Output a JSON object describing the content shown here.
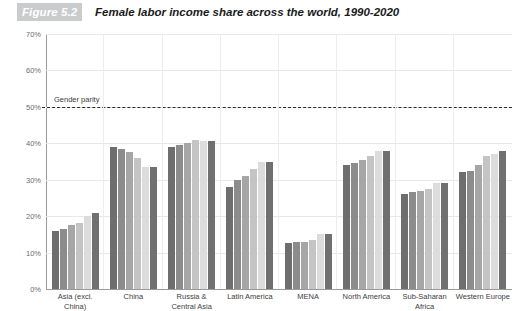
{
  "figure": {
    "badge": "Figure 5.2",
    "title": "Female labor income share across the world, 1990-2020"
  },
  "annotation": {
    "parity_label": "Gender parity",
    "parity_value": 50
  },
  "colors": {
    "badge_background": "#c9cbcc",
    "axis": "#9a9a9a",
    "gridline": "#e8e8e8",
    "parity_line": "#2b2b2b",
    "series": [
      "#6e6e6e",
      "#8c8c8c",
      "#a6a6a6",
      "#c4c4c4",
      "#dcdcdc",
      "#707070"
    ]
  },
  "chart_data": {
    "type": "bar",
    "title": "Female labor income share across the world, 1990-2020",
    "xlabel": "",
    "ylabel": "",
    "ylim": [
      0,
      70
    ],
    "ytick_labels": [
      "70%",
      "60%",
      "50%",
      "40%",
      "30%",
      "20%",
      "10%",
      "0%"
    ],
    "ytick_values": [
      70,
      60,
      50,
      40,
      30,
      20,
      10,
      0
    ],
    "grid": true,
    "legend_position": "bottom",
    "categories": [
      "Asia (excl. China)",
      "China",
      "Russia & Central Asia",
      "Latin America",
      "MENA",
      "North America",
      "Sub-Saharan Africa",
      "Western Europe"
    ],
    "series": [
      {
        "name": "1990",
        "values": [
          16.0,
          39.0,
          39.0,
          28.0,
          12.5,
          34.0,
          26.0,
          32.0
        ]
      },
      {
        "name": "1995",
        "values": [
          16.5,
          38.5,
          39.5,
          30.0,
          13.0,
          34.5,
          26.5,
          32.5
        ]
      },
      {
        "name": "2000",
        "values": [
          17.5,
          37.5,
          40.0,
          31.0,
          13.0,
          35.5,
          27.0,
          34.0
        ]
      },
      {
        "name": "2005",
        "values": [
          18.0,
          36.0,
          41.0,
          33.0,
          13.5,
          36.5,
          27.5,
          36.5
        ]
      },
      {
        "name": "2010",
        "values": [
          20.0,
          33.5,
          40.5,
          35.0,
          15.0,
          38.0,
          29.0,
          37.0
        ]
      },
      {
        "name": "2015-2020",
        "values": [
          21.0,
          33.5,
          40.5,
          35.0,
          15.0,
          38.0,
          29.0,
          38.0
        ]
      }
    ]
  }
}
